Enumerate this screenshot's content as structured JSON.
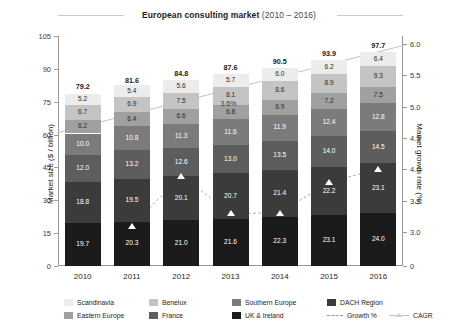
{
  "chart_data": {
    "type": "bar",
    "stacked": true,
    "title_strong": "European consulting market",
    "title_light": "(2010 – 2016)",
    "title_full": "European consulting market (2010 – 2016)",
    "xlabel": "",
    "ylabel": "Market size ($ / billion)",
    "ylabel_secondary": "Market growth rate (%)",
    "categories": [
      "2010",
      "2011",
      "2012",
      "2013",
      "2014",
      "2015",
      "2016"
    ],
    "ylim": [
      0,
      105
    ],
    "yticks": [
      "0",
      "15",
      "30",
      "45",
      "60",
      "75",
      "90",
      "105"
    ],
    "ylim_secondary": [
      3.0,
      6.0
    ],
    "yticks_secondary": [
      "0",
      "3.0",
      "3.5",
      "4.0",
      "4.5",
      "5.0",
      "5.5",
      "6.0"
    ],
    "grid": false,
    "legend_position": "bottom",
    "series": [
      {
        "name": "UK & Ireland",
        "color": "#1b1b1b",
        "values": [
          19.7,
          20.3,
          21.0,
          21.6,
          22.3,
          23.1,
          24.0
        ]
      },
      {
        "name": "DACH Region",
        "color": "#3b3b3b",
        "values": [
          18.8,
          19.5,
          20.1,
          20.7,
          21.4,
          22.2,
          23.1
        ]
      },
      {
        "name": "France",
        "color": "#5d5d5d",
        "values": [
          12.0,
          13.2,
          12.6,
          13.0,
          13.5,
          14.0,
          14.5
        ]
      },
      {
        "name": "Southern Europe",
        "color": "#7b7b7b",
        "values": [
          10.0,
          10.8,
          11.3,
          11.6,
          11.9,
          12.4,
          12.8
        ]
      },
      {
        "name": "Eastern Europe",
        "color": "#a0a0a0",
        "values": [
          6.2,
          6.4,
          6.6,
          6.8,
          6.9,
          7.2,
          7.5
        ]
      },
      {
        "name": "Benelux",
        "color": "#c4c4c4",
        "values": [
          6.7,
          6.9,
          7.5,
          8.1,
          8.6,
          8.9,
          9.3
        ]
      },
      {
        "name": "Scandinavia",
        "color": "#ececec",
        "values": [
          5.2,
          5.4,
          5.6,
          5.7,
          6.0,
          6.2,
          6.4
        ]
      }
    ],
    "totals": [
      79.2,
      81.6,
      84.8,
      87.6,
      90.5,
      93.9,
      97.7
    ],
    "growth_line": {
      "name": "Growth %",
      "color": "#9a9a9a",
      "style": "dashed",
      "marker": "triangle",
      "values": [
        null,
        3.1,
        3.9,
        3.3,
        3.3,
        3.8,
        4.0
      ]
    },
    "cagr_line": {
      "name": "CAGR",
      "color": "#c2c2c2",
      "style": "solid",
      "annotation": "3.6%",
      "start_value": 4.58,
      "end_value": 5.98
    },
    "segment_labels": {
      "2010": [
        "5.2",
        "6.7",
        "6.2",
        "10.0",
        "12.0",
        "18.8",
        "19.7"
      ],
      "2011": [
        "5.4",
        "6.9",
        "6.4",
        "10.8",
        "13.2",
        "19.5",
        "20.3"
      ],
      "2012": [
        "5.6",
        "7.5",
        "6.6",
        "11.3",
        "12.6",
        "20.1",
        "21.0"
      ],
      "2013": [
        "5.7",
        "8.1",
        "6.8",
        "11.6",
        "13.0",
        "20.7",
        "21.6"
      ],
      "2014": [
        "6.0",
        "8.6",
        "6.9",
        "11.9",
        "13.5",
        "21.4",
        "22.3"
      ],
      "2015": [
        "6.2",
        "8.9",
        "7.2",
        "12.4",
        "14.0",
        "22.2",
        "23.1"
      ],
      "2016": [
        "6.4",
        "9.3",
        "7.5",
        "12.8",
        "14.5",
        "23.1",
        "24.0"
      ]
    },
    "total_labels": [
      "79.2",
      "81.6",
      "84.8",
      "87.6",
      "90.5",
      "93.9",
      "97.7"
    ]
  },
  "legend": {
    "row1": [
      {
        "label": "Scandinavia",
        "color": "#ececec"
      },
      {
        "label": "Benelux",
        "color": "#c4c4c4"
      },
      {
        "label": "Southern Europe",
        "color": "#7b7b7b"
      },
      {
        "label": "DACH Region",
        "color": "#3b3b3b"
      }
    ],
    "row2": [
      {
        "label": "Eastern Europe",
        "color": "#a0a0a0"
      },
      {
        "label": "France",
        "color": "#5d5d5d"
      },
      {
        "label": "UK & Ireland",
        "color": "#1b1b1b"
      },
      {
        "label": "Growth %",
        "color": "#9a9a9a"
      },
      {
        "label": "CAGR",
        "color": "#c2c2c2"
      }
    ]
  }
}
